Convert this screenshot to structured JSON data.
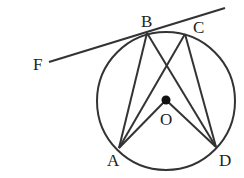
{
  "diagram": {
    "type": "circle-geometry",
    "stroke_color": "#333333",
    "label_color": "#222222",
    "circle": {
      "center": "O",
      "cx": 166,
      "cy": 101,
      "r": 69
    },
    "points": {
      "A": {
        "label": "A",
        "x": 119,
        "y": 148
      },
      "B": {
        "label": "B",
        "x": 147,
        "y": 33
      },
      "C": {
        "label": "C",
        "x": 185,
        "y": 34
      },
      "D": {
        "label": "D",
        "x": 216,
        "y": 147
      },
      "O": {
        "label": "O",
        "x": 166,
        "y": 100
      },
      "F": {
        "label": "F",
        "x": 49,
        "y": 62
      }
    },
    "segments": [
      [
        "F",
        "B",
        "tangent line extended beyond B"
      ],
      [
        "A",
        "B"
      ],
      [
        "B",
        "D"
      ],
      [
        "A",
        "C"
      ],
      [
        "C",
        "D"
      ],
      [
        "A",
        "O"
      ],
      [
        "O",
        "D"
      ]
    ]
  }
}
